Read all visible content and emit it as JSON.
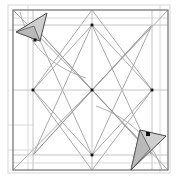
{
  "canvas": {
    "width": 180,
    "height": 181,
    "background": "#ffffff",
    "title": "geometric-wireframe-with-two-cursor-markers"
  },
  "palette": {
    "background": "#ffffff",
    "frame_stroke": "#6e6e6e",
    "wire_stroke": "#9a9a9a",
    "wire_stroke_light": "#c4c4c4",
    "ghost_stroke": "#d8d8d8",
    "arc_stroke": "#a8a8a8",
    "marker_fill": "#cfcfcf",
    "marker_stroke": "#4a4a4a",
    "marker_fold_fill": "#b9b9b9",
    "point_fill": "#111111"
  },
  "frame": {
    "name": "outer-square-frame",
    "x": 13,
    "y": 10,
    "width": 155,
    "height": 160,
    "stroke_width": 1.2
  },
  "ghost_frame": {
    "name": "offset-ghost-frame",
    "x": 8,
    "y": 5,
    "width": 162,
    "height": 168,
    "stroke_width": 1
  },
  "nodes": [
    {
      "name": "node-center",
      "x": 92,
      "y": 90,
      "spokes": 8
    },
    {
      "name": "node-top-mid",
      "x": 92,
      "y": 25,
      "spokes": 8
    },
    {
      "name": "node-bottom-mid",
      "x": 92,
      "y": 155,
      "spokes": 8
    },
    {
      "name": "node-left-mid",
      "x": 33,
      "y": 90,
      "spokes": 6
    },
    {
      "name": "node-right-mid",
      "x": 152,
      "y": 90,
      "spokes": 6
    }
  ],
  "wireframe": {
    "name": "inner-lattice",
    "horizontal_rails": [
      {
        "y": 25,
        "x1": 13,
        "x2": 168
      },
      {
        "y": 90,
        "x1": 13,
        "x2": 168
      },
      {
        "y": 155,
        "x1": 13,
        "x2": 168
      }
    ],
    "vertical_rails": [
      {
        "x": 33,
        "y1": 10,
        "y2": 170
      },
      {
        "x": 92,
        "y1": 10,
        "y2": 170
      },
      {
        "x": 152,
        "y1": 10,
        "y2": 170
      }
    ],
    "diagonals": [
      {
        "x1": 33,
        "y1": 25,
        "x2": 92,
        "y2": 90
      },
      {
        "x1": 152,
        "y1": 25,
        "x2": 92,
        "y2": 90
      },
      {
        "x1": 33,
        "y1": 155,
        "x2": 92,
        "y2": 90
      },
      {
        "x1": 152,
        "y1": 155,
        "x2": 92,
        "y2": 90
      },
      {
        "x1": 33,
        "y1": 25,
        "x2": 92,
        "y2": 155
      },
      {
        "x1": 152,
        "y1": 25,
        "x2": 92,
        "y2": 155
      },
      {
        "x1": 33,
        "y1": 155,
        "x2": 92,
        "y2": 25
      },
      {
        "x1": 152,
        "y1": 155,
        "x2": 92,
        "y2": 25
      },
      {
        "x1": 33,
        "y1": 90,
        "x2": 92,
        "y2": 25
      },
      {
        "x1": 33,
        "y1": 90,
        "x2": 92,
        "y2": 155
      },
      {
        "x1": 152,
        "y1": 90,
        "x2": 92,
        "y2": 25
      },
      {
        "x1": 152,
        "y1": 90,
        "x2": 92,
        "y2": 155
      },
      {
        "x1": 13,
        "y1": 10,
        "x2": 92,
        "y2": 90
      },
      {
        "x1": 168,
        "y1": 10,
        "x2": 92,
        "y2": 90
      },
      {
        "x1": 13,
        "y1": 170,
        "x2": 92,
        "y2": 90
      },
      {
        "x1": 168,
        "y1": 170,
        "x2": 92,
        "y2": 90
      },
      {
        "x1": 33,
        "y1": 25,
        "x2": 152,
        "y2": 155
      },
      {
        "x1": 152,
        "y1": 25,
        "x2": 33,
        "y2": 155
      },
      {
        "x1": 92,
        "y1": 10,
        "x2": 33,
        "y2": 90
      },
      {
        "x1": 92,
        "y1": 10,
        "x2": 152,
        "y2": 90
      },
      {
        "x1": 92,
        "y1": 170,
        "x2": 33,
        "y2": 90
      },
      {
        "x1": 92,
        "y1": 170,
        "x2": 152,
        "y2": 90
      }
    ],
    "ghost_rails": [
      {
        "x1": 8,
        "y1": 30,
        "x2": 33,
        "y2": 30
      },
      {
        "x1": 8,
        "y1": 125,
        "x2": 33,
        "y2": 125
      },
      {
        "x1": 8,
        "y1": 150,
        "x2": 33,
        "y2": 150
      },
      {
        "x1": 28,
        "y1": 5,
        "x2": 28,
        "y2": 170
      },
      {
        "x1": 160,
        "y1": 5,
        "x2": 160,
        "y2": 173
      },
      {
        "x1": 13,
        "y1": 163,
        "x2": 168,
        "y2": 163
      },
      {
        "x1": 13,
        "y1": 18,
        "x2": 168,
        "y2": 18
      }
    ]
  },
  "arcs": [
    {
      "name": "arc-top-left",
      "d": "M 20 12 C 28 44, 50 66, 86 78"
    },
    {
      "name": "arc-bottom-right",
      "d": "M 162 170 C 152 140, 130 118, 96 106"
    }
  ],
  "markers": [
    {
      "name": "cursor-marker-top-left",
      "label": "top-left pointer",
      "polygon": "16,32 47,13 40,41",
      "fold": "16,32 40,41 34,26",
      "point": {
        "x": 35,
        "y": 40,
        "size": 3
      }
    },
    {
      "name": "cursor-marker-bottom-right",
      "label": "bottom-right pointer",
      "polygon": "131,170 166,136 140,130",
      "fold": "131,170 140,130 150,149",
      "point": {
        "x": 148,
        "y": 134,
        "size": 4
      }
    }
  ],
  "a11y": {
    "figure_caption": "Symmetric square wireframe lattice with two shaded cursor markers at opposite corners"
  }
}
